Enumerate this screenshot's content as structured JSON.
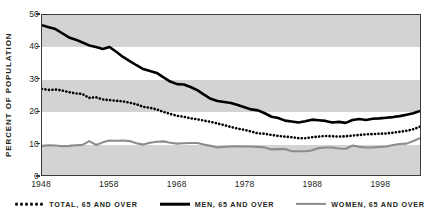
{
  "chart_data": {
    "type": "line",
    "title": "",
    "xlabel": "",
    "ylabel": "PERCENT OF POPULATION",
    "xlim": [
      1948,
      2004
    ],
    "ylim": [
      0,
      50
    ],
    "grid": false,
    "legend_position": "bottom",
    "y_ticks": [
      50,
      40,
      30,
      20,
      10,
      0
    ],
    "x_ticks": [
      1948,
      1958,
      1968,
      1978,
      1988,
      1998
    ],
    "x": [
      1948,
      1949,
      1950,
      1951,
      1952,
      1953,
      1954,
      1955,
      1956,
      1957,
      1958,
      1959,
      1960,
      1961,
      1962,
      1963,
      1964,
      1965,
      1966,
      1967,
      1968,
      1969,
      1970,
      1971,
      1972,
      1973,
      1974,
      1975,
      1976,
      1977,
      1978,
      1979,
      1980,
      1981,
      1982,
      1983,
      1984,
      1985,
      1986,
      1987,
      1988,
      1989,
      1990,
      1991,
      1992,
      1993,
      1994,
      1995,
      1996,
      1997,
      1998,
      1999,
      2000,
      2001,
      2002,
      2003,
      2004
    ],
    "series": [
      {
        "name": "TOTAL, 65 AND OVER",
        "style": "dotted",
        "color": "#000000",
        "values": [
          26.9,
          26.6,
          26.7,
          26.4,
          25.9,
          25.5,
          25.3,
          24.1,
          24.3,
          23.6,
          23.4,
          23.2,
          23.0,
          22.6,
          22.1,
          21.3,
          21.0,
          20.5,
          19.7,
          19.1,
          18.5,
          18.2,
          17.7,
          17.4,
          17.0,
          16.6,
          16.1,
          15.6,
          15.0,
          14.5,
          14.1,
          13.6,
          13.0,
          12.9,
          12.5,
          12.2,
          12.0,
          11.8,
          11.5,
          11.5,
          11.8,
          12.0,
          12.2,
          12.1,
          12.0,
          12.1,
          12.3,
          12.5,
          12.7,
          12.8,
          12.9,
          13.0,
          13.2,
          13.5,
          13.8,
          14.3,
          15.1
        ]
      },
      {
        "name": "MEN, 65 AND OVER",
        "style": "solid",
        "color": "#000000",
        "values": [
          46.8,
          46.2,
          45.6,
          44.3,
          43.0,
          42.3,
          41.4,
          40.5,
          40.0,
          39.4,
          40.0,
          38.5,
          36.9,
          35.6,
          34.3,
          33.1,
          32.5,
          31.9,
          30.5,
          29.2,
          28.4,
          28.3,
          27.5,
          26.5,
          25.1,
          23.8,
          23.1,
          22.8,
          22.5,
          21.9,
          21.2,
          20.5,
          20.2,
          19.3,
          18.2,
          17.8,
          17.0,
          16.7,
          16.4,
          16.8,
          17.3,
          17.1,
          16.9,
          16.4,
          16.6,
          16.3,
          17.2,
          17.5,
          17.2,
          17.6,
          17.7,
          17.9,
          18.1,
          18.4,
          18.8,
          19.3,
          20.0
        ]
      },
      {
        "name": "WOMEN, 65 AND OVER",
        "style": "solid",
        "color": "#8c8c8c",
        "values": [
          9.1,
          9.3,
          9.2,
          9.0,
          9.1,
          9.3,
          9.4,
          10.6,
          9.4,
          10.2,
          10.8,
          10.7,
          10.8,
          10.6,
          9.9,
          9.5,
          10.1,
          10.4,
          10.5,
          10.1,
          9.8,
          9.9,
          10.0,
          10.0,
          9.5,
          9.1,
          8.6,
          8.8,
          8.9,
          9.0,
          8.9,
          8.9,
          8.8,
          8.6,
          8.0,
          8.1,
          8.1,
          7.4,
          7.4,
          7.4,
          7.7,
          8.4,
          8.6,
          8.6,
          8.3,
          8.2,
          9.2,
          8.8,
          8.6,
          8.6,
          8.8,
          8.9,
          9.4,
          9.7,
          9.8,
          10.6,
          11.5
        ]
      }
    ]
  },
  "legend": {
    "items": [
      {
        "label": "TOTAL, 65 AND OVER",
        "marker": "dotted-line-icon"
      },
      {
        "label": "MEN, 65 AND OVER",
        "marker": "solid-black-line-icon"
      },
      {
        "label": "WOMEN, 65 AND OVER",
        "marker": "solid-gray-line-icon"
      }
    ]
  },
  "axis": {
    "y_title": "PERCENT OF POPULATION",
    "y_labels": [
      "50",
      "40",
      "30",
      "20",
      "10",
      "0"
    ],
    "x_labels": [
      "1948",
      "1958",
      "1968",
      "1978",
      "1988",
      "1998"
    ]
  },
  "colors": {
    "band": "#d3d3d3",
    "frame": "#3c3c3c",
    "men": "#000000",
    "women": "#8c8c8c",
    "total": "#000000",
    "text": "#231f20"
  }
}
